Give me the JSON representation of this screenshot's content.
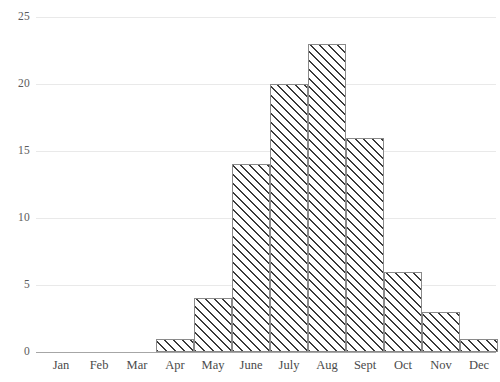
{
  "chart_data": {
    "type": "bar",
    "title": "",
    "subtitle": "",
    "xlabel": "",
    "ylabel": "",
    "categories": [
      "Jan",
      "Feb",
      "Mar",
      "Apr",
      "May",
      "June",
      "July",
      "Aug",
      "Sept",
      "Oct",
      "Nov",
      "Dec"
    ],
    "values": [
      0,
      0,
      0,
      1,
      4,
      14,
      20,
      23,
      16,
      6,
      3,
      1
    ],
    "ylim": [
      0,
      25
    ],
    "ytick_labels": [
      "0",
      "5",
      "10",
      "15",
      "20",
      "25"
    ],
    "ytick_values": [
      0,
      5,
      10,
      15,
      20,
      25
    ],
    "grid": true,
    "legend": "none",
    "bar_style": {
      "fill": "diagonal-hatch",
      "hatch_direction": "forward-slash",
      "hatch_color": "#3a3a3a",
      "background": "#ffffff",
      "border_color": "#8a8a8a"
    },
    "colors": {
      "gridline": "#e9e9e9",
      "axis": "#a6a6a6",
      "text": "#4a4a4a",
      "background": "#ffffff"
    }
  }
}
